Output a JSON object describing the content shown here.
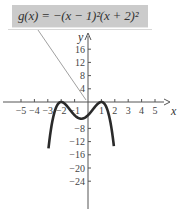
{
  "chart_data": {
    "type": "line",
    "title": "g(x) = −(x − 1)²(x + 2)²",
    "function": "g(x) = -(x-1)^2 (x+2)^2",
    "xlabel": "x",
    "ylabel": "y",
    "xlim": [
      -6,
      6
    ],
    "ylim": [
      -31,
      22
    ],
    "x_ticks": [
      -5,
      -4,
      -3,
      -2,
      -1,
      1,
      2,
      3,
      4,
      5
    ],
    "y_ticks": [
      16,
      12,
      8,
      4,
      -8,
      -12,
      -16,
      -20,
      -24
    ],
    "x_tick_labels": [
      "−5",
      "−4",
      "−3",
      "−2",
      "−1",
      "1",
      "2",
      "3",
      "4",
      "5"
    ],
    "y_tick_labels": [
      "16",
      "12",
      "8",
      "4",
      "−8",
      "−12",
      "−16",
      "−20",
      "−24"
    ],
    "grid": false,
    "legend": "none",
    "series": [
      {
        "name": "g(x)",
        "x": [
          -2.95,
          -2.75,
          -2.5,
          -2.25,
          -2.0,
          -1.75,
          -1.5,
          -1.0,
          -0.5,
          0.0,
          0.5,
          0.75,
          1.0,
          1.25,
          1.5,
          1.75,
          1.93
        ],
        "values": [
          -29.8,
          -20.3,
          -11.4,
          -3.4,
          0.0,
          -0.48,
          -1.56,
          -4.0,
          -5.06,
          -4.0,
          -1.56,
          -0.48,
          0.0,
          -0.83,
          -3.06,
          -6.5,
          -9.9
        ]
      }
    ],
    "annotations": [
      {
        "text": "g(x) = −(x − 1)²(x + 2)²",
        "points_to": [
          0,
          0
        ]
      }
    ],
    "colors": {
      "curve": "#2a2a2a",
      "axes": "#555555",
      "label_box": "#cbcbcb"
    }
  },
  "label": {
    "text": "g(x) = −(x − 1)²(x + 2)²"
  },
  "axes": {
    "x_label": "x",
    "y_label": "y"
  }
}
